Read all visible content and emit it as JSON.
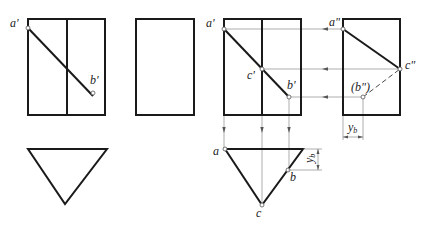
{
  "figure": {
    "given": {
      "labels": {
        "a_prime": "a'",
        "b_prime": "b'"
      }
    },
    "solution": {
      "labels": {
        "a_prime": "a'",
        "b_prime": "b'",
        "c_prime": "c'",
        "a_double": "a\"",
        "c_double": "c\"",
        "b_double": "(b\")",
        "a": "a",
        "b": "b",
        "c": "c",
        "y": "y",
        "y_sub": "b"
      }
    }
  }
}
